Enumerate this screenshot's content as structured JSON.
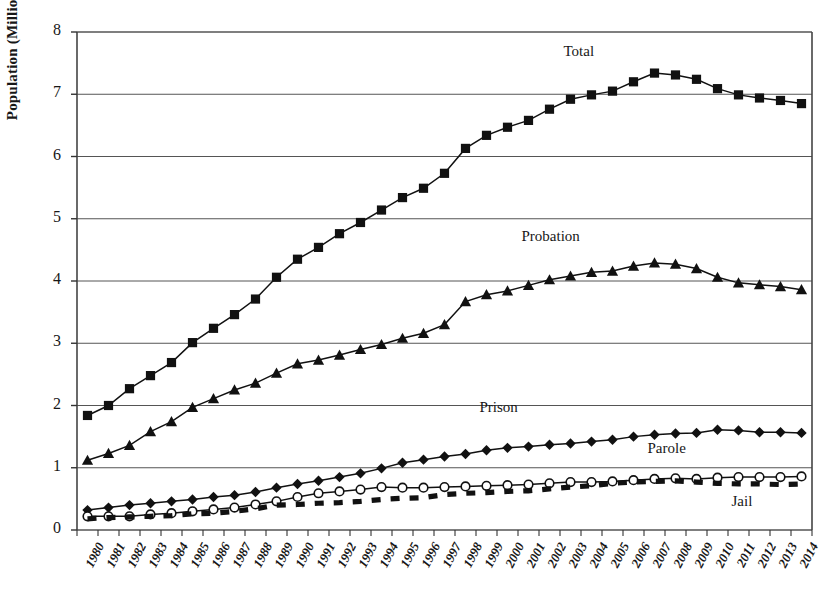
{
  "chart_data": {
    "type": "line",
    "title": "",
    "xlabel": "",
    "ylabel": "Population (Millions)",
    "ylim": [
      0,
      8
    ],
    "yticks": [
      0,
      1,
      2,
      3,
      4,
      5,
      6,
      7,
      8
    ],
    "grid": "horizontal",
    "legend_position": "inline-annotations",
    "categories": [
      "1980",
      "1981",
      "1982",
      "1983",
      "1984",
      "1985",
      "1986",
      "1987",
      "1988",
      "1989",
      "1990",
      "1991",
      "1992",
      "1993",
      "1994",
      "1995",
      "1996",
      "1997",
      "1998",
      "1999",
      "2000",
      "2001",
      "2002",
      "2003",
      "2004",
      "2005",
      "2006",
      "2007",
      "2008",
      "2009",
      "2010",
      "2011",
      "2012",
      "2013",
      "2014"
    ],
    "series": [
      {
        "name": "Total",
        "marker": "square",
        "line": "solid",
        "color": "#111111",
        "values": [
          1.84,
          2.0,
          2.27,
          2.48,
          2.69,
          3.01,
          3.24,
          3.46,
          3.71,
          4.06,
          4.35,
          4.54,
          4.76,
          4.94,
          5.14,
          5.34,
          5.49,
          5.73,
          6.13,
          6.34,
          6.47,
          6.58,
          6.76,
          6.92,
          6.99,
          7.05,
          7.2,
          7.34,
          7.31,
          7.24,
          7.09,
          6.99,
          6.94,
          6.9,
          6.85
        ]
      },
      {
        "name": "Probation",
        "marker": "triangle",
        "line": "solid",
        "color": "#111111",
        "values": [
          1.12,
          1.23,
          1.36,
          1.58,
          1.74,
          1.97,
          2.11,
          2.25,
          2.36,
          2.52,
          2.67,
          2.73,
          2.81,
          2.9,
          2.98,
          3.08,
          3.16,
          3.3,
          3.67,
          3.78,
          3.84,
          3.93,
          4.02,
          4.08,
          4.14,
          4.16,
          4.24,
          4.29,
          4.27,
          4.2,
          4.06,
          3.97,
          3.94,
          3.91,
          3.86
        ]
      },
      {
        "name": "Prison",
        "marker": "diamond",
        "line": "solid",
        "color": "#111111",
        "values": [
          0.32,
          0.36,
          0.4,
          0.43,
          0.46,
          0.49,
          0.53,
          0.56,
          0.61,
          0.68,
          0.74,
          0.79,
          0.85,
          0.91,
          0.99,
          1.08,
          1.13,
          1.18,
          1.22,
          1.28,
          1.32,
          1.34,
          1.37,
          1.39,
          1.42,
          1.45,
          1.5,
          1.53,
          1.55,
          1.56,
          1.61,
          1.6,
          1.57,
          1.57,
          1.56
        ]
      },
      {
        "name": "Parole",
        "marker": "open-circle",
        "line": "solid",
        "color": "#111111",
        "values": [
          0.22,
          0.22,
          0.22,
          0.25,
          0.27,
          0.3,
          0.33,
          0.36,
          0.41,
          0.46,
          0.53,
          0.59,
          0.62,
          0.65,
          0.69,
          0.68,
          0.68,
          0.69,
          0.7,
          0.71,
          0.72,
          0.73,
          0.75,
          0.77,
          0.77,
          0.78,
          0.8,
          0.82,
          0.83,
          0.82,
          0.84,
          0.85,
          0.85,
          0.85,
          0.86
        ]
      },
      {
        "name": "Jail",
        "marker": "square",
        "line": "dashed",
        "color": "#111111",
        "values": [
          0.18,
          0.2,
          0.21,
          0.22,
          0.23,
          0.26,
          0.27,
          0.3,
          0.34,
          0.4,
          0.41,
          0.43,
          0.44,
          0.46,
          0.49,
          0.51,
          0.52,
          0.57,
          0.59,
          0.6,
          0.62,
          0.63,
          0.66,
          0.69,
          0.71,
          0.75,
          0.77,
          0.78,
          0.79,
          0.77,
          0.75,
          0.74,
          0.74,
          0.73,
          0.74
        ]
      }
    ],
    "annotations": [
      {
        "text": "Total",
        "x": 2004,
        "y": 7.64
      },
      {
        "text": "Probation",
        "x": 2002,
        "y": 4.68
      },
      {
        "text": "Prison",
        "x": 2000,
        "y": 1.93
      },
      {
        "text": "Parole",
        "x": 2008,
        "y": 1.27
      },
      {
        "text": "Jail",
        "x": 2012,
        "y": 0.42
      }
    ]
  },
  "axis": {
    "y_title": "Population (Millions)"
  }
}
